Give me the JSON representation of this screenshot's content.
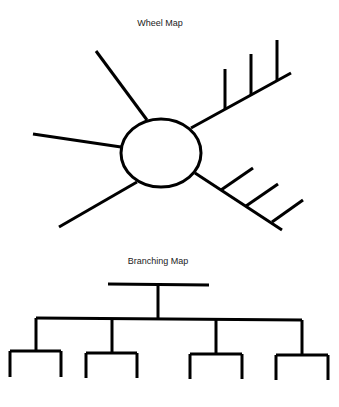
{
  "wheel_map": {
    "title": "Wheel Map",
    "center": {
      "cx": 161,
      "cy": 153,
      "rx": 40,
      "ry": 34
    },
    "spokes": [
      {
        "name": "upper-left",
        "x1": 147,
        "y1": 120,
        "x2": 96,
        "y2": 51,
        "ticks": []
      },
      {
        "name": "left",
        "x1": 121,
        "y1": 147,
        "x2": 33,
        "y2": 134,
        "ticks": []
      },
      {
        "name": "lower-left",
        "x1": 137,
        "y1": 182,
        "x2": 59,
        "y2": 227,
        "ticks": []
      },
      {
        "name": "upper-right",
        "x1": 191,
        "y1": 128,
        "x2": 291,
        "y2": 73,
        "ticks": [
          {
            "x1": 225,
            "y1": 109,
            "x2": 225,
            "y2": 69
          },
          {
            "x1": 251,
            "y1": 95,
            "x2": 251,
            "y2": 54
          },
          {
            "x1": 277,
            "y1": 80,
            "x2": 277,
            "y2": 40
          }
        ]
      },
      {
        "name": "lower-right",
        "x1": 195,
        "y1": 173,
        "x2": 282,
        "y2": 230,
        "ticks": [
          {
            "x1": 221,
            "y1": 190,
            "x2": 253,
            "y2": 168
          },
          {
            "x1": 246,
            "y1": 206,
            "x2": 278,
            "y2": 184
          },
          {
            "x1": 272,
            "y1": 222,
            "x2": 303,
            "y2": 200
          }
        ]
      }
    ]
  },
  "branching_map": {
    "title": "Branching Map",
    "top_bar": {
      "x1": 108,
      "y1": 284,
      "x2": 209,
      "y2": 285
    },
    "stem": {
      "x1": 158,
      "y1": 284,
      "x2": 158,
      "y2": 319
    },
    "main_bar": {
      "x1": 36,
      "y1": 318,
      "x2": 302,
      "y2": 320
    },
    "branches": [
      {
        "drop_x": 36,
        "drop_top": 318,
        "bar_y": 351,
        "left": 10,
        "right": 61,
        "bottom": 377
      },
      {
        "drop_x": 112,
        "drop_top": 319,
        "bar_y": 353,
        "left": 86,
        "right": 137,
        "bottom": 378
      },
      {
        "drop_x": 216,
        "drop_top": 320,
        "bar_y": 354,
        "left": 190,
        "right": 242,
        "bottom": 379
      },
      {
        "drop_x": 302,
        "drop_top": 320,
        "bar_y": 355,
        "left": 276,
        "right": 328,
        "bottom": 380
      }
    ]
  },
  "style": {
    "stroke": "#000000",
    "stroke_width": 3,
    "background": "#ffffff"
  }
}
